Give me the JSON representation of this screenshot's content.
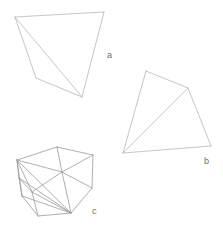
{
  "figure": {
    "background_color": "#ffffff",
    "stroke_color": "#b8b8b8",
    "stroke_color_dark": "#9a9a9a",
    "stroke_width": 0.8,
    "label_color": "#6e6e6e",
    "width": 223,
    "height": 239
  },
  "shapes": [
    {
      "id": "a",
      "label": "a",
      "label_position": {
        "x": 107,
        "y": 56
      },
      "kind": "quadrilateral-with-diagonal",
      "vertices": [
        {
          "name": "top-left",
          "x": 15,
          "y": 17
        },
        {
          "name": "top-right",
          "x": 104,
          "y": 12
        },
        {
          "name": "bottom",
          "x": 82,
          "y": 97
        },
        {
          "name": "left-lower",
          "x": 36,
          "y": 78
        }
      ],
      "edges": [
        {
          "from": 0,
          "to": 1
        },
        {
          "from": 1,
          "to": 2
        },
        {
          "from": 2,
          "to": 3
        },
        {
          "from": 3,
          "to": 0
        },
        {
          "from": 0,
          "to": 2
        }
      ]
    },
    {
      "id": "b",
      "label": "b",
      "label_position": {
        "x": 204,
        "y": 162
      },
      "kind": "quadrilateral-with-diagonal",
      "vertices": [
        {
          "name": "top",
          "x": 146,
          "y": 71
        },
        {
          "name": "right-upper",
          "x": 188,
          "y": 88
        },
        {
          "name": "right-lower",
          "x": 211,
          "y": 146
        },
        {
          "name": "bottom-left",
          "x": 123,
          "y": 153
        }
      ],
      "edges": [
        {
          "from": 0,
          "to": 1
        },
        {
          "from": 1,
          "to": 2
        },
        {
          "from": 2,
          "to": 3
        },
        {
          "from": 3,
          "to": 0
        },
        {
          "from": 1,
          "to": 3
        }
      ]
    },
    {
      "id": "c",
      "label": "c",
      "label_position": {
        "x": 92,
        "y": 212
      },
      "kind": "triangulated-polygon",
      "vertices": [
        {
          "name": "v0-left-upper",
          "x": 17,
          "y": 160
        },
        {
          "name": "v1-top",
          "x": 57,
          "y": 147
        },
        {
          "name": "v2-right-upper",
          "x": 93,
          "y": 155
        },
        {
          "name": "v3-right-lower",
          "x": 92,
          "y": 188
        },
        {
          "name": "v4-bottom-right",
          "x": 71,
          "y": 213
        },
        {
          "name": "v5-bottom-left",
          "x": 38,
          "y": 216
        },
        {
          "name": "v6-left-lower",
          "x": 22,
          "y": 196
        },
        {
          "name": "v7-center",
          "x": 62,
          "y": 172
        },
        {
          "name": "v8-mid-left",
          "x": 32,
          "y": 192
        },
        {
          "name": "v9-left-mid",
          "x": 19,
          "y": 178
        }
      ],
      "edges": [
        {
          "from": 0,
          "to": 1
        },
        {
          "from": 1,
          "to": 2
        },
        {
          "from": 2,
          "to": 3
        },
        {
          "from": 3,
          "to": 4
        },
        {
          "from": 4,
          "to": 5
        },
        {
          "from": 5,
          "to": 6
        },
        {
          "from": 6,
          "to": 0
        },
        {
          "from": 0,
          "to": 7
        },
        {
          "from": 1,
          "to": 7
        },
        {
          "from": 2,
          "to": 7
        },
        {
          "from": 3,
          "to": 7
        },
        {
          "from": 4,
          "to": 7
        },
        {
          "from": 7,
          "to": 8
        },
        {
          "from": 0,
          "to": 8
        },
        {
          "from": 0,
          "to": 9
        },
        {
          "from": 9,
          "to": 8
        },
        {
          "from": 8,
          "to": 4
        },
        {
          "from": 9,
          "to": 4
        },
        {
          "from": 0,
          "to": 4
        },
        {
          "from": 6,
          "to": 4
        },
        {
          "from": 8,
          "to": 5
        },
        {
          "from": 9,
          "to": 6
        }
      ]
    }
  ]
}
